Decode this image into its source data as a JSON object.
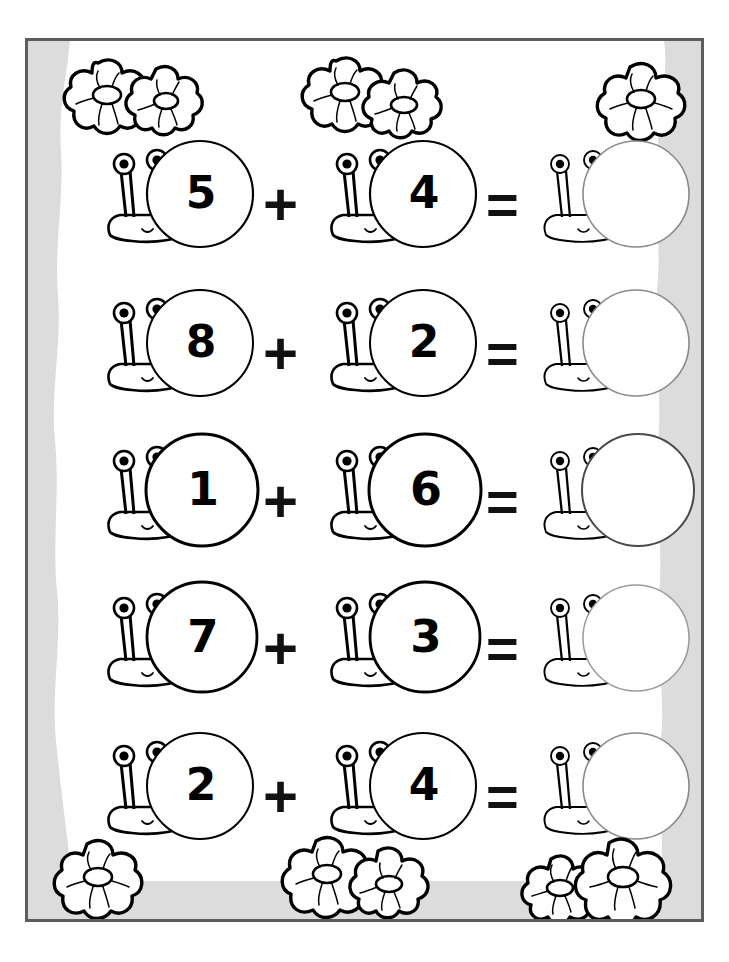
{
  "worksheet": {
    "title": "Snail Addition Worksheet",
    "theme": "snails-and-flowers",
    "frame_color": "#5d5d5d",
    "background_color": "#dcdcdc",
    "paper_color": "#ffffff",
    "ink_color": "#000000",
    "plus_symbol": "+",
    "equals_symbol": "=",
    "answer_value": ""
  },
  "equations": [
    {
      "index": 1,
      "addend_1": "5",
      "plus": "+",
      "addend_2": "4",
      "equals": "=",
      "answer": ""
    },
    {
      "index": 2,
      "addend_1": "8",
      "plus": "+",
      "addend_2": "2",
      "equals": "=",
      "answer": ""
    },
    {
      "index": 3,
      "addend_1": "1",
      "plus": "+",
      "addend_2": "6",
      "equals": "=",
      "answer": ""
    },
    {
      "index": 4,
      "addend_1": "7",
      "plus": "+",
      "addend_2": "3",
      "equals": "=",
      "answer": ""
    },
    {
      "index": 5,
      "addend_1": "2",
      "plus": "+",
      "addend_2": "4",
      "equals": "=",
      "answer": ""
    }
  ],
  "decorations": {
    "top_left": {
      "name": "flower-pair",
      "count": 2
    },
    "top_center": {
      "name": "flower-pair",
      "count": 2
    },
    "top_right": {
      "name": "flower-single",
      "count": 1
    },
    "bottom_left": {
      "name": "flower-single",
      "count": 1
    },
    "bottom_center": {
      "name": "flower-pair",
      "count": 2
    },
    "bottom_right": {
      "name": "flower-pair",
      "count": 2
    }
  }
}
